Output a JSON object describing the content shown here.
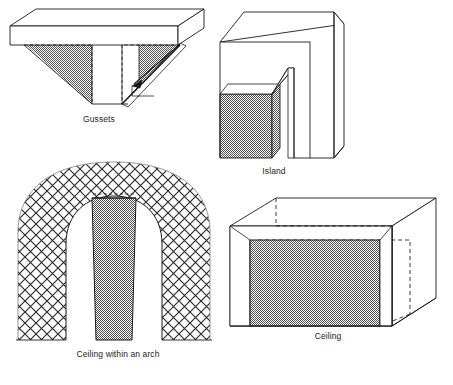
{
  "page": {
    "background_color": "#ffffff",
    "width": 453,
    "height": 385,
    "line_color": "#1a1a1a",
    "fill_white": "#ffffff",
    "fill_shaded": "#8c8c8c",
    "hatch_color": "#2b2b2b"
  },
  "figures": [
    {
      "id": "gussets",
      "caption": "Gussets",
      "description": "Isometric inverted-T slab with two shaded triangular gusset plates under the flange",
      "shaded_elements": "two triangular gussets",
      "hidden_lines": "dashed outline of gusset back edges",
      "has_leader_arrow": true
    },
    {
      "id": "island",
      "caption": "Island",
      "description": "Isometric block with a vertical slot cut, leaving a shaded rectangular island block at the lower left",
      "shaded_elements": "island block front and side faces",
      "hidden_lines": "none",
      "has_leader_arrow": false
    },
    {
      "id": "arch",
      "caption": "Ceiling within an arch",
      "description": "Cross-hatched masonry arch with a shaded vertical ceiling panel spanning the opening",
      "shaded_elements": "central ceiling panel",
      "hidden_lines": "dashed line across top of panel",
      "has_leader_arrow": false
    },
    {
      "id": "ceiling",
      "caption": "Ceiling",
      "description": "Isometric room box with a shaded rectangular ceiling panel set inside the volume",
      "shaded_elements": "ceiling panel",
      "hidden_lines": "dashed outline of hidden box edges",
      "has_leader_arrow": false
    }
  ],
  "captions": {
    "gussets": "Gussets",
    "island": "Island",
    "arch": "Ceiling within an arch",
    "ceiling": "Ceiling"
  }
}
